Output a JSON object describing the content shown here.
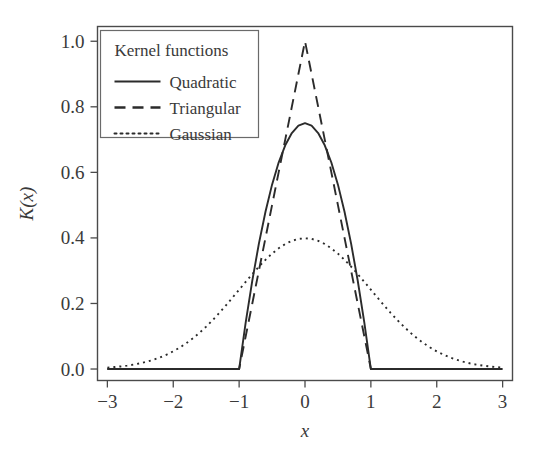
{
  "chart_data": {
    "type": "line",
    "title": "",
    "subtitle": "",
    "xlabel": "x",
    "ylabel": "K(x)",
    "xlim": [
      -3.15,
      3.15
    ],
    "ylim": [
      -0.035,
      1.045
    ],
    "xticks": [
      -3,
      -2,
      -1,
      0,
      1,
      2,
      3
    ],
    "xticklabels": [
      "−3",
      "−2",
      "−1",
      "0",
      "1",
      "2",
      "3"
    ],
    "yticks": [
      0.0,
      0.2,
      0.4,
      0.6,
      0.8,
      1.0
    ],
    "yticklabels": [
      "0.0",
      "0.2",
      "0.4",
      "0.6",
      "0.8",
      "1.0"
    ],
    "grid": false,
    "legend": {
      "position": "upper-left-inside",
      "title": "Kernel functions",
      "entries": [
        {
          "name": "Quadratic",
          "style": "solid",
          "color": "#2b2b2b"
        },
        {
          "name": "Triangular",
          "style": "dashed",
          "color": "#2b2b2b"
        },
        {
          "name": "Gaussian",
          "style": "dotted",
          "color": "#2b2b2b"
        }
      ]
    },
    "x": [
      -3.0,
      -2.9,
      -2.8,
      -2.7,
      -2.6,
      -2.5,
      -2.4,
      -2.3,
      -2.2,
      -2.1,
      -2.0,
      -1.9,
      -1.8,
      -1.7,
      -1.6,
      -1.5,
      -1.4,
      -1.3,
      -1.2,
      -1.1,
      -1.0,
      -0.9,
      -0.8,
      -0.7,
      -0.6,
      -0.5,
      -0.4,
      -0.3,
      -0.2,
      -0.1,
      0.0,
      0.1,
      0.2,
      0.3,
      0.4,
      0.5,
      0.6,
      0.7,
      0.8,
      0.9,
      1.0,
      1.1,
      1.2,
      1.3,
      1.4,
      1.5,
      1.6,
      1.7,
      1.8,
      1.9,
      2.0,
      2.1,
      2.2,
      2.3,
      2.4,
      2.5,
      2.6,
      2.7,
      2.8,
      2.9,
      3.0
    ],
    "series": [
      {
        "name": "Quadratic",
        "formula": "0.75*(1-x^2) for |x|<=1, else 0",
        "style": "solid",
        "peak": 0.75,
        "support": [
          -1,
          1
        ],
        "values": [
          0,
          0,
          0,
          0,
          0,
          0,
          0,
          0,
          0,
          0,
          0,
          0,
          0,
          0,
          0,
          0,
          0,
          0,
          0,
          0,
          0,
          0.1425,
          0.27,
          0.3825,
          0.48,
          0.5625,
          0.63,
          0.6825,
          0.72,
          0.7425,
          0.75,
          0.7425,
          0.72,
          0.6825,
          0.63,
          0.5625,
          0.48,
          0.3825,
          0.27,
          0.1425,
          0,
          0,
          0,
          0,
          0,
          0,
          0,
          0,
          0,
          0,
          0,
          0,
          0,
          0,
          0,
          0,
          0,
          0,
          0,
          0,
          0
        ]
      },
      {
        "name": "Triangular",
        "formula": "1-|x| for |x|<=1, else 0",
        "style": "dashed",
        "peak": 1.0,
        "support": [
          -1,
          1
        ],
        "values": [
          0,
          0,
          0,
          0,
          0,
          0,
          0,
          0,
          0,
          0,
          0,
          0,
          0,
          0,
          0,
          0,
          0,
          0,
          0,
          0,
          0,
          0.1,
          0.2,
          0.3,
          0.4,
          0.5,
          0.6,
          0.7,
          0.8,
          0.9,
          1.0,
          0.9,
          0.8,
          0.7,
          0.6,
          0.5,
          0.4,
          0.3,
          0.2,
          0.1,
          0,
          0,
          0,
          0,
          0,
          0,
          0,
          0,
          0,
          0,
          0,
          0,
          0,
          0,
          0,
          0,
          0,
          0,
          0,
          0,
          0
        ]
      },
      {
        "name": "Gaussian",
        "formula": "(1/sqrt(2*pi))*exp(-x^2/2)",
        "style": "dotted",
        "peak": 0.3989,
        "support": [
          -3,
          3
        ],
        "values": [
          0.0044,
          0.006,
          0.0079,
          0.0104,
          0.0136,
          0.0175,
          0.0224,
          0.0283,
          0.0355,
          0.044,
          0.054,
          0.0656,
          0.079,
          0.094,
          0.1109,
          0.1295,
          0.1497,
          0.1714,
          0.1942,
          0.2179,
          0.242,
          0.2661,
          0.2897,
          0.3123,
          0.3332,
          0.3521,
          0.3683,
          0.3814,
          0.391,
          0.397,
          0.3989,
          0.397,
          0.391,
          0.3814,
          0.3683,
          0.3521,
          0.3332,
          0.3123,
          0.2897,
          0.2661,
          0.242,
          0.2179,
          0.1942,
          0.1714,
          0.1497,
          0.1295,
          0.1109,
          0.094,
          0.079,
          0.0656,
          0.054,
          0.044,
          0.0355,
          0.0283,
          0.0224,
          0.0175,
          0.0136,
          0.0104,
          0.0079,
          0.006,
          0.0044
        ]
      }
    ],
    "colors": {
      "line": "#2b2b2b",
      "axis": "#4a4a4a",
      "text": "#3a3a3a",
      "background": "#ffffff"
    }
  }
}
